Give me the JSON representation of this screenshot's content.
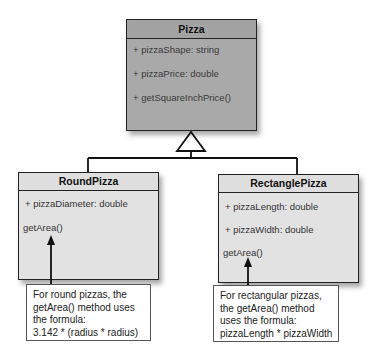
{
  "diagram": {
    "type": "uml-class-diagram",
    "parent_class": {
      "name": "Pizza",
      "members": [
        "+ pizzaShape: string",
        "+ pizzaPrice: double",
        "+ getSquareInchPrice()"
      ]
    },
    "child_classes": [
      {
        "name": "RoundPizza",
        "members": [
          "+ pizzaDiameter: double",
          "getArea()"
        ],
        "note": [
          "For round pizzas, the",
          "getArea() method uses",
          "the formula:",
          "3.142 * (radius * radius)"
        ]
      },
      {
        "name": "RectanglePizza",
        "members": [
          "+ pizzaLength: double",
          "+ pizzaWidth: double",
          "getArea()"
        ],
        "note": [
          "For rectangular pizzas,",
          "the getArea() method",
          "uses the formula:",
          "pizzaLength * pizzaWidth"
        ]
      }
    ],
    "relationships": [
      {
        "from": "RoundPizza",
        "to": "Pizza",
        "type": "inheritance"
      },
      {
        "from": "RectanglePizza",
        "to": "Pizza",
        "type": "inheritance"
      }
    ],
    "colors": {
      "parent_fill": "#a9a9a9",
      "child_fill": "#e2e2e2",
      "border": "#222222"
    }
  }
}
